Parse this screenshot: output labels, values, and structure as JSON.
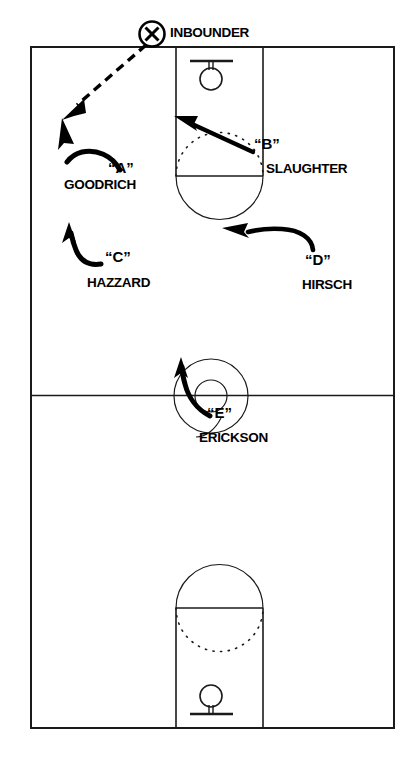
{
  "diagram": {
    "type": "basketball-play-diagram",
    "colors": {
      "court_line": "#1a1a1a",
      "motion_path": "#000000",
      "pass_path": "#000000",
      "text": "#000000",
      "background": "#ffffff"
    },
    "inbounder": {
      "marker": "X",
      "label": "INBOUNDER",
      "marker_icon": "circled-x-icon"
    },
    "players": [
      {
        "tag": "“A”",
        "name": "GOODRICH"
      },
      {
        "tag": "“B”",
        "name": "SLAUGHTER"
      },
      {
        "tag": "“C”",
        "name": "HAZZARD"
      },
      {
        "tag": "“D”",
        "name": "HIRSCH"
      },
      {
        "tag": "“E”",
        "name": "ERICKSON"
      }
    ],
    "court_features": [
      "out-of-bounds-boundary",
      "midcourt-line",
      "center-circle",
      "top-key",
      "top-free-throw-circle",
      "top-backboard",
      "top-hoop",
      "bottom-key",
      "bottom-free-throw-circle",
      "bottom-backboard",
      "bottom-hoop"
    ],
    "movements": [
      {
        "player": "“A”",
        "kind": "cut",
        "note": "curl cut to left wing"
      },
      {
        "player": "“B”",
        "kind": "cut",
        "note": "cut from right elbow toward left of lane"
      },
      {
        "player": "“C”",
        "kind": "cut",
        "note": "cut up the left side"
      },
      {
        "player": "“D”",
        "kind": "cut",
        "note": "cut from right toward free-throw area"
      },
      {
        "player": "“E”",
        "kind": "cut",
        "note": "cut up through the center circle"
      }
    ],
    "pass": {
      "from": "INBOUNDER",
      "to": "“A”",
      "style": "dashed"
    }
  }
}
